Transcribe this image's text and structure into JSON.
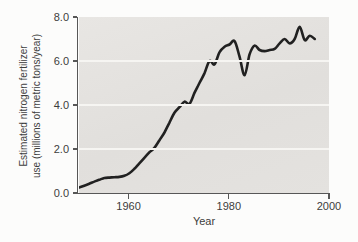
{
  "figure": {
    "background_color": "#fcfcfb",
    "panel_color": "#e3e1de",
    "gridline_color": "#f6f5f2",
    "axis_color": "#575757",
    "text_color": "#3c3c3c",
    "line_color": "#212121"
  },
  "chart_data": {
    "type": "line",
    "title": "",
    "xlabel": "Year",
    "ylabel": "Estimated nitrogen fertilizer use (millions of metric tons/year)",
    "ylabel_lines": [
      "Estimated nitrogen fertilizer",
      "use (millions of metric tons/year)"
    ],
    "xlim": [
      1950,
      2000
    ],
    "ylim": [
      0,
      8
    ],
    "xticks": [
      {
        "value": 1960,
        "label": "1960"
      },
      {
        "value": 1980,
        "label": "1980"
      },
      {
        "value": 2000,
        "label": "2000"
      }
    ],
    "yticks": [
      {
        "value": 0,
        "label": "0.0"
      },
      {
        "value": 2,
        "label": "2.0"
      },
      {
        "value": 4,
        "label": "4.0"
      },
      {
        "value": 6,
        "label": "6.0"
      },
      {
        "value": 8,
        "label": "8.0"
      }
    ],
    "grid_y": [
      2,
      4,
      6
    ],
    "legend": "none",
    "series": [
      {
        "name": "estimated nitrogen fertilizer use",
        "x": [
          1950,
          1951,
          1952,
          1953,
          1954,
          1955,
          1956,
          1957,
          1958,
          1959,
          1960,
          1961,
          1962,
          1963,
          1964,
          1965,
          1966,
          1967,
          1968,
          1969,
          1970,
          1971,
          1972,
          1973,
          1974,
          1975,
          1976,
          1977,
          1978,
          1979,
          1980,
          1981,
          1982,
          1983,
          1984,
          1985,
          1986,
          1987,
          1988,
          1989,
          1990,
          1991,
          1992,
          1993,
          1994,
          1995,
          1996,
          1997
        ],
        "y": [
          0.25,
          0.33,
          0.42,
          0.52,
          0.6,
          0.68,
          0.7,
          0.72,
          0.73,
          0.78,
          0.9,
          1.1,
          1.35,
          1.6,
          1.85,
          2.05,
          2.4,
          2.75,
          3.2,
          3.65,
          3.9,
          4.15,
          4.05,
          4.55,
          5.0,
          5.45,
          6.0,
          5.85,
          6.4,
          6.65,
          6.75,
          6.9,
          6.2,
          5.35,
          6.3,
          6.7,
          6.5,
          6.45,
          6.5,
          6.55,
          6.8,
          7.0,
          6.8,
          7.0,
          7.55,
          6.95,
          7.15,
          7.0
        ]
      }
    ]
  }
}
